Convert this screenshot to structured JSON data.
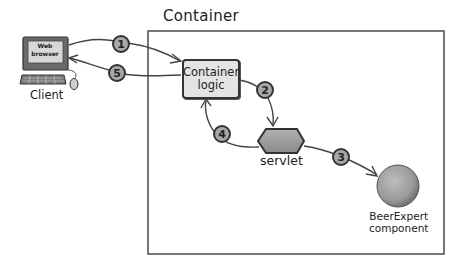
{
  "diagram": {
    "container": {
      "title": "Container",
      "logic": {
        "line1": "Container",
        "line2": "logic"
      }
    },
    "client": {
      "label": "Client",
      "screen": {
        "line1": "Web",
        "line2": "browser"
      }
    },
    "servlet": {
      "label": "servlet"
    },
    "component": {
      "line1": "BeerExpert",
      "line2": "component"
    },
    "steps": [
      {
        "number": "1",
        "from": "client",
        "to": "container-logic"
      },
      {
        "number": "2",
        "from": "container-logic",
        "to": "servlet"
      },
      {
        "number": "3",
        "from": "servlet",
        "to": "beerexpert-component"
      },
      {
        "number": "4",
        "from": "servlet",
        "to": "container-logic"
      },
      {
        "number": "5",
        "from": "container-logic",
        "to": "client"
      }
    ]
  },
  "colors": {
    "stroke": "#333333",
    "node_fill": "#e4e4e4",
    "step_fill": "#a8a8a8",
    "hexagon_fill": "#9a9a9a",
    "sphere_fill": "#a0a0a0"
  }
}
